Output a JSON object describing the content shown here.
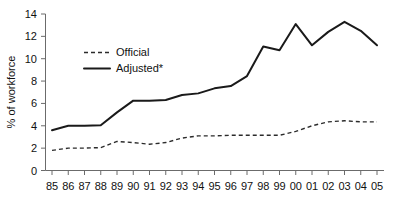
{
  "chart_data": {
    "type": "line",
    "title": "",
    "xlabel": "",
    "ylabel": "% of workforce",
    "ylim": [
      0,
      14
    ],
    "yticks": [
      0,
      2,
      4,
      6,
      8,
      10,
      12,
      14
    ],
    "grid": false,
    "legend_position": "upper-left-inside",
    "categories": [
      "85",
      "86",
      "87",
      "88",
      "89",
      "90",
      "91",
      "92",
      "93",
      "94",
      "95",
      "96",
      "97",
      "98",
      "99",
      "00",
      "01",
      "02",
      "03",
      "04",
      "05"
    ],
    "series": [
      {
        "name": "Official",
        "style": "dashed",
        "color": "#2b2b2b",
        "values": [
          1.8,
          2.0,
          2.0,
          2.05,
          2.6,
          2.5,
          2.35,
          2.5,
          2.9,
          3.1,
          3.1,
          3.15,
          3.15,
          3.15,
          3.15,
          3.5,
          4.0,
          4.35,
          4.45,
          4.35,
          4.35
        ]
      },
      {
        "name": "Adjusted*",
        "style": "solid",
        "color": "#1a1a1a",
        "values": [
          3.6,
          4.0,
          4.0,
          4.05,
          5.2,
          6.25,
          6.25,
          6.3,
          6.75,
          6.9,
          7.35,
          7.55,
          8.45,
          11.1,
          10.75,
          13.1,
          11.2,
          12.4,
          13.3,
          12.5,
          11.2
        ]
      }
    ]
  },
  "legend": {
    "entries": [
      {
        "label": "Official",
        "style": "dashed"
      },
      {
        "label": "Adjusted*",
        "style": "solid"
      }
    ]
  },
  "axes": {
    "y_title": "% of workforce",
    "y_tick_labels": [
      "14",
      "12",
      "10",
      "8",
      "6",
      "4",
      "2",
      "0"
    ],
    "x_tick_labels": [
      "85",
      "86",
      "87",
      "88",
      "89",
      "90",
      "91",
      "92",
      "93",
      "94",
      "95",
      "96",
      "97",
      "98",
      "99",
      "00",
      "01",
      "02",
      "03",
      "04",
      "05"
    ]
  }
}
